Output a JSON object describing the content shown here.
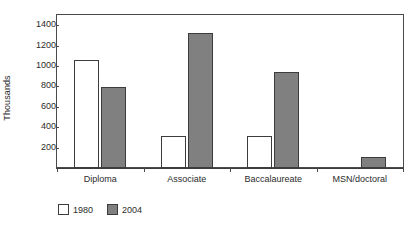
{
  "chart_data": {
    "type": "bar",
    "title": "",
    "subtitle": "",
    "xlabel": "",
    "ylabel": "Thousands",
    "categories": [
      "Diploma",
      "Associate",
      "Baccalaureate",
      "MSN/doctoral"
    ],
    "series": [
      {
        "name": "1980",
        "color": "#ffffff",
        "values": [
          1060,
          310,
          310,
          0
        ]
      },
      {
        "name": "2004",
        "color": "#808080",
        "values": [
          790,
          1325,
          940,
          105
        ]
      }
    ],
    "ylim": [
      0,
      1500
    ],
    "yticks": [
      200,
      400,
      600,
      800,
      1000,
      1200,
      1400
    ],
    "ytick_labels": [
      "200",
      "400",
      "600",
      "800",
      "1000",
      "1200",
      "1400"
    ],
    "grid": false,
    "legend_position": "below-left",
    "legend_entries": [
      "1980",
      "2004"
    ],
    "annotations": []
  },
  "colors": {
    "series_1980": "#ffffff",
    "series_2004": "#808080",
    "axis": "#3c3c3c",
    "text": "#2b2b2b",
    "background": "#ffffff"
  }
}
